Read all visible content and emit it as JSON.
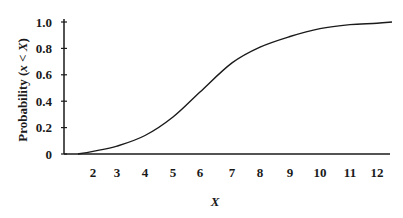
{
  "chart_data": {
    "type": "line",
    "title": "",
    "xlabel": "X",
    "ylabel": "Probability (x < X)",
    "x_ticks": [
      "2",
      "3",
      "4",
      "5",
      "6",
      "7",
      "8",
      "9",
      "10",
      "11",
      "12"
    ],
    "y_ticks": [
      "0",
      "0.2",
      "0.4",
      "0.6",
      "0.8",
      "1.0"
    ],
    "ylim": [
      0,
      1.0
    ],
    "xlim": [
      1,
      12.5
    ],
    "grid": false,
    "legend": null,
    "series": [
      {
        "name": "Cumulative probability",
        "x": [
          1.4,
          2,
          3,
          4,
          5,
          6,
          7,
          8,
          9,
          10,
          11,
          12,
          12.5
        ],
        "y": [
          0.0,
          0.02,
          0.06,
          0.14,
          0.28,
          0.47,
          0.69,
          0.81,
          0.89,
          0.95,
          0.98,
          0.99,
          1.0
        ]
      }
    ],
    "colors": {
      "line": "#1a1a1a",
      "axis": "#1a1a1a"
    }
  },
  "layout_px": {
    "x_tick_px": [
      93,
      117,
      145,
      173,
      200,
      232,
      260,
      290,
      320,
      350,
      377
    ],
    "x_start_px": 78,
    "x_end_px": 392,
    "y_zero_px": 154,
    "y_one_px": 22,
    "y_axis_px": 64
  }
}
